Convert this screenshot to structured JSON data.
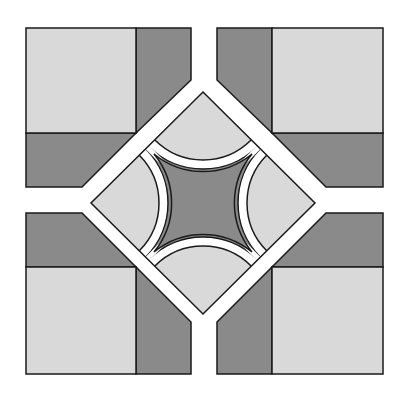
{
  "diagram": {
    "title": "",
    "type": "quilt-block-pattern",
    "colors": {
      "light": "#d9d9d9",
      "dark": "#8a8a8a",
      "outline": "#1a1a1a",
      "background": "#ffffff"
    },
    "corner_blocks": [
      {
        "position": "top-left"
      },
      {
        "position": "top-right"
      },
      {
        "position": "bottom-left"
      },
      {
        "position": "bottom-right"
      }
    ],
    "center": {
      "shape": "diamond",
      "arc_pieces": 4,
      "star": "concave-star"
    }
  }
}
